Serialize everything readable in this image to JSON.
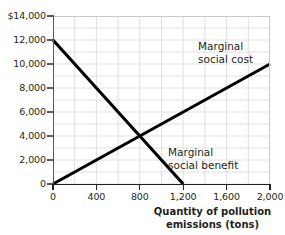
{
  "chart_data": {
    "type": "line",
    "title": "",
    "subtitle": "",
    "xlabel": "Quantity of pollution emissions (tons)",
    "ylabel": "",
    "xlim": [
      0,
      2000
    ],
    "ylim": [
      0,
      14000
    ],
    "grid": true,
    "legend_position": "inline-annotation",
    "x_ticks": [
      0,
      400,
      800,
      1200,
      1600,
      2000
    ],
    "x_tick_labels": [
      "0",
      "400",
      "800",
      "1,200",
      "1,600",
      "2,000"
    ],
    "y_ticks": [
      0,
      2000,
      4000,
      6000,
      8000,
      10000,
      12000,
      14000
    ],
    "y_tick_labels": [
      "0",
      "2,000",
      "4,000",
      "6,000",
      "8,000",
      "10,000",
      "12,000",
      "$14,000"
    ],
    "x_minor_step": 200,
    "y_minor_step": 1000,
    "series": [
      {
        "name": "Marginal social benefit",
        "label": "Marginal\nsocial benefit",
        "label_line1": "Marginal",
        "label_line2": "social benefit",
        "color": "#000000",
        "x": [
          0,
          1200
        ],
        "values": [
          12000,
          0
        ]
      },
      {
        "name": "Marginal social cost",
        "label": "Marginal\nsocial cost",
        "label_line1": "Marginal",
        "label_line2": "social cost",
        "color": "#000000",
        "x": [
          0,
          2000
        ],
        "values": [
          0,
          10000
        ]
      }
    ],
    "annotations": [
      {
        "name": "intersection",
        "x": 800,
        "y": 4000,
        "text": ""
      }
    ],
    "axis_title_line1": "Quantity of pollution",
    "axis_title_line2": "emissions (tons)",
    "colors": {
      "grid": "#d7d8da",
      "axis": "#231f20",
      "curve": "#000000",
      "background": "#ffffff"
    }
  }
}
